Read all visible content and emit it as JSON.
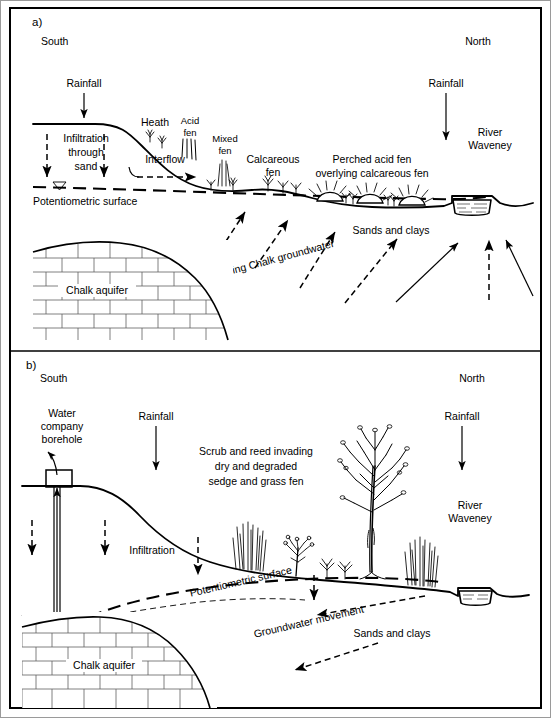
{
  "figure": {
    "type": "hydrogeological-cross-section",
    "panel_count": 2
  },
  "panel_a": {
    "id": "a)",
    "orientation_left": "South",
    "orientation_right": "North",
    "labels": {
      "rainfall_left": "Rainfall",
      "rainfall_right": "Rainfall",
      "infiltration_l1": "Infiltration",
      "infiltration_l2": "through",
      "infiltration_l3": "sand",
      "potentiometric_surface": "Potentiometric surface",
      "interflow": "Interflow",
      "heath": "Heath",
      "acid_fen_l1": "Acid",
      "acid_fen_l2": "fen",
      "mixed_fen_l1": "Mixed",
      "mixed_fen_l2": "fen",
      "calcareous_fen_l1": "Calcareous",
      "calcareous_fen_l2": "fen",
      "perched_l1": "Perched acid fen",
      "perched_l2": "overlying calcareous fen",
      "river_l1": "River",
      "river_l2": "Waveney",
      "sands_and_clays": "Sands and clays",
      "rising_groundwater": "Rising Chalk groundwater",
      "chalk_aquifer": "Chalk aquifer"
    }
  },
  "panel_b": {
    "id": "b)",
    "orientation_left": "South",
    "orientation_right": "North",
    "labels": {
      "borehole_l1": "Water",
      "borehole_l2": "company",
      "borehole_l3": "borehole",
      "rainfall_left": "Rainfall",
      "rainfall_right": "Rainfall",
      "scrub_l1": "Scrub and reed invading",
      "scrub_l2": "dry and degraded",
      "scrub_l3": "sedge and grass fen",
      "infiltration": "Infiltration",
      "potentiometric_surface": "Potentiometric  surface",
      "groundwater_movement": "Groundwater movement",
      "sands_and_clays": "Sands and clays",
      "chalk_aquifer": "Chalk aquifer",
      "river_l1": "River",
      "river_l2": "Waveney"
    }
  },
  "colors": {
    "ink": "#000000",
    "brick_stroke": "#5f5f5f",
    "frame_outer": "#9a9a9a",
    "background": "#ffffff"
  }
}
